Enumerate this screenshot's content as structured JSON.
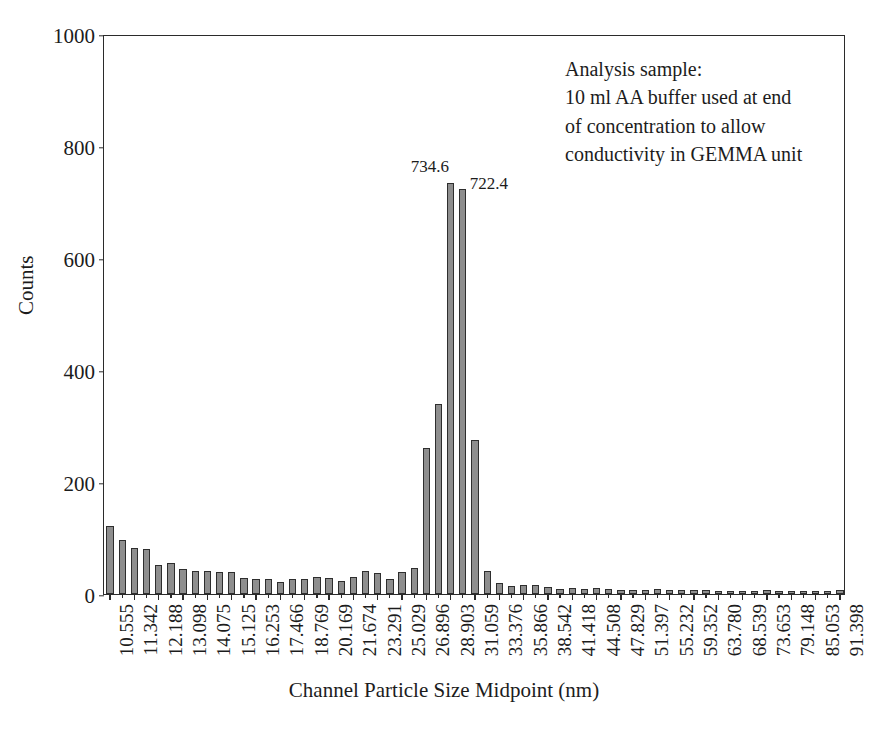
{
  "chart_data": {
    "type": "bar",
    "title": "",
    "xlabel": "Channel Particle Size Midpoint (nm)",
    "ylabel": "Counts",
    "ylim": [
      0,
      1000
    ],
    "y_ticks": [
      0,
      200,
      400,
      600,
      800,
      1000
    ],
    "grid": false,
    "legend": null,
    "x_tick_labels": [
      "10.555",
      "11.342",
      "12.188",
      "13.098",
      "14.075",
      "15.125",
      "16.253",
      "17.466",
      "18.769",
      "20.169",
      "21.674",
      "23.291",
      "25.029",
      "26.896",
      "28.903",
      "31.059",
      "33.376",
      "35.866",
      "38.542",
      "41.418",
      "44.508",
      "47.829",
      "51.397",
      "55.232",
      "59.352",
      "63.780",
      "68.539",
      "73.653",
      "79.148",
      "85.053",
      "91.398"
    ],
    "categories": [
      "10.555",
      "10.944",
      "11.342",
      "11.760",
      "12.188",
      "12.637",
      "13.098",
      "13.580",
      "14.075",
      "14.592",
      "15.125",
      "15.681",
      "16.253",
      "16.850",
      "17.466",
      "18.108",
      "18.769",
      "19.459",
      "20.169",
      "20.910",
      "21.674",
      "22.470",
      "23.291",
      "24.147",
      "25.029",
      "25.949",
      "26.896",
      "27.884",
      "28.903",
      "29.966",
      "31.059",
      "32.200",
      "33.376",
      "34.602",
      "35.866",
      "37.184",
      "38.542",
      "39.958",
      "41.418",
      "42.940",
      "44.508",
      "46.144",
      "47.829",
      "49.586",
      "51.397",
      "53.286",
      "55.232",
      "57.262",
      "59.352",
      "61.533",
      "63.780",
      "66.124",
      "68.539",
      "71.058",
      "73.653",
      "76.359",
      "79.148",
      "82.056",
      "85.053",
      "88.179",
      "91.398"
    ],
    "values": [
      122,
      96,
      82,
      80,
      52,
      55,
      44,
      41,
      41,
      40,
      40,
      28,
      27,
      27,
      21,
      26,
      27,
      30,
      28,
      24,
      31,
      41,
      38,
      27,
      40,
      46,
      260,
      340,
      734.6,
      722.4,
      275,
      41,
      20,
      14,
      16,
      16,
      13,
      9,
      11,
      9,
      10,
      9,
      8,
      7,
      8,
      9,
      8,
      7,
      8,
      7,
      6,
      6,
      6,
      6,
      7,
      6,
      6,
      5,
      5,
      6,
      7
    ],
    "data_labels": [
      {
        "text": "734.6",
        "index": 28
      },
      {
        "text": "722.4",
        "index": 29
      }
    ],
    "annotation": {
      "lines": [
        "Analysis sample:",
        "10 ml AA buffer used at end",
        "of concentration to allow",
        "conductivity in GEMMA unit"
      ]
    },
    "colors": {
      "bar_fill": "#8e8e8e",
      "bar_edge": "#2e2e2e",
      "axis": "#2b2b2b",
      "text": "#1c1c1c",
      "background": "#ffffff"
    }
  }
}
